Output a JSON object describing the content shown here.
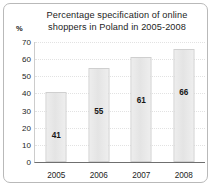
{
  "chart_data": {
    "type": "bar",
    "title": "Percentage specification of online\nshoppers in Poland in 2005-2008",
    "categories": [
      "2005",
      "2006",
      "2007",
      "2008"
    ],
    "values": [
      41,
      55,
      61,
      66
    ],
    "xlabel": "",
    "ylabel": "%",
    "ylim": [
      0,
      70
    ],
    "yticks": [
      70,
      60,
      50,
      40,
      30,
      20,
      10,
      0
    ],
    "grid": true,
    "legend": null,
    "value_labels": [
      "41",
      "55",
      "61",
      "66"
    ],
    "colors": {
      "bar_fill": "#e8e8e8",
      "bar_border": "#cfcfcf",
      "text": "#1d1d1d",
      "axis": "#6f6f6f",
      "frame": "#b9b9b9",
      "background": "#ffffff"
    }
  }
}
